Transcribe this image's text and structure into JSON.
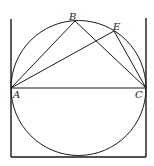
{
  "diagram": {
    "type": "geometry-figure",
    "colors": {
      "ink": "#1a1a1a",
      "background": "#ffffff"
    },
    "points": {
      "A": {
        "label": "A",
        "x": 11,
        "y": 88
      },
      "B": {
        "label": "B",
        "x": 75,
        "y": 21
      },
      "C": {
        "label": "C",
        "x": 146,
        "y": 88
      },
      "E": {
        "label": "E",
        "x": 114,
        "y": 31
      }
    },
    "circle": {
      "cx": 78.5,
      "cy": 88,
      "r": 67.5
    },
    "segments": [
      {
        "from": "A",
        "to": "B"
      },
      {
        "from": "A",
        "to": "E"
      },
      {
        "from": "A",
        "to": "C"
      },
      {
        "from": "B",
        "to": "C"
      },
      {
        "from": "E",
        "to": "C"
      }
    ],
    "frame": {
      "left": {
        "x1": 11,
        "y1": 19,
        "x2": 11,
        "y2": 157
      },
      "right": {
        "x1": 146,
        "y1": 18,
        "x2": 146,
        "y2": 157
      },
      "bottom": {
        "x1": 11,
        "y1": 157,
        "x2": 146,
        "y2": 157
      }
    },
    "labels": {
      "A": "A",
      "B": "B",
      "C": "C",
      "E": "E"
    }
  }
}
